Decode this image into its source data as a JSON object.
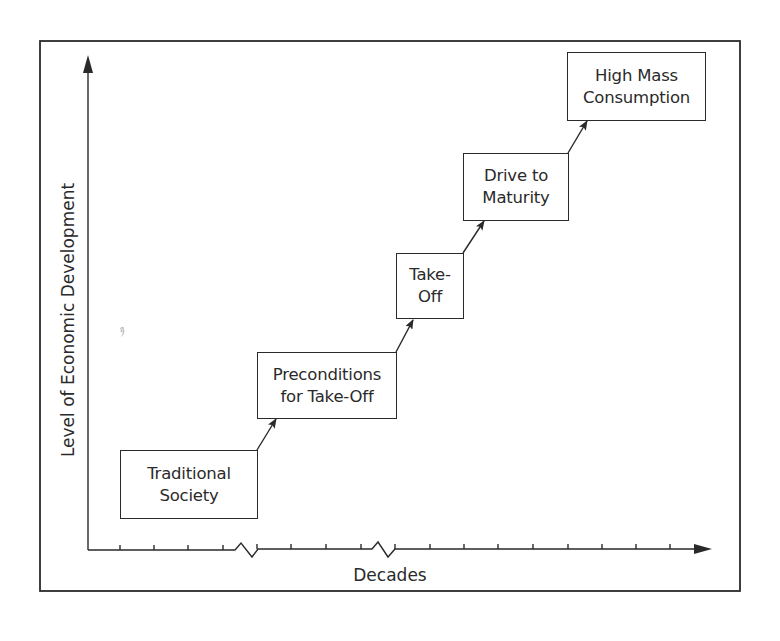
{
  "diagram": {
    "x_axis": {
      "label": "Decades",
      "breaks": 2,
      "tick_count": 16
    },
    "y_axis": {
      "label": "Level of Economic Development"
    },
    "stages": [
      {
        "id": "traditional-society",
        "label": "Traditional\nSociety",
        "order": 1
      },
      {
        "id": "preconditions-for-take-off",
        "label": "Preconditions\nfor Take-Off",
        "order": 2
      },
      {
        "id": "take-off",
        "label": "Take-\nOff",
        "order": 3
      },
      {
        "id": "drive-to-maturity",
        "label": "Drive to\nMaturity",
        "order": 4
      },
      {
        "id": "high-mass-consumption",
        "label": "High Mass\nConsumption",
        "order": 5
      }
    ],
    "connections": [
      {
        "from": "traditional-society",
        "to": "preconditions-for-take-off"
      },
      {
        "from": "preconditions-for-take-off",
        "to": "take-off"
      },
      {
        "from": "take-off",
        "to": "drive-to-maturity"
      },
      {
        "from": "drive-to-maturity",
        "to": "high-mass-consumption"
      }
    ],
    "colors": {
      "ink": "#2a2a2a",
      "background": "#ffffff"
    }
  }
}
